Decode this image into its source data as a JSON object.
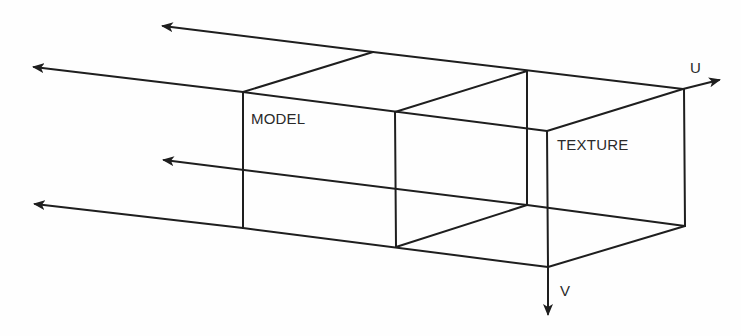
{
  "diagram": {
    "type": "texture-mapping-projection",
    "labels": {
      "model": "MODEL",
      "texture": "TEXTURE",
      "u_axis": "U",
      "v_axis": "V"
    },
    "colors": {
      "line": "#1e1e1e",
      "text": "#2a2a2a",
      "background": "#fefefe"
    },
    "elements": [
      {
        "id": "model-box",
        "label": "MODEL"
      },
      {
        "id": "texture-box",
        "label": "TEXTURE"
      },
      {
        "id": "u-axis-arrow",
        "label": "U",
        "direction": "right"
      },
      {
        "id": "v-axis-arrow",
        "label": "V",
        "direction": "down"
      },
      {
        "id": "projection-arrows",
        "count": 4,
        "direction": "left"
      }
    ]
  }
}
